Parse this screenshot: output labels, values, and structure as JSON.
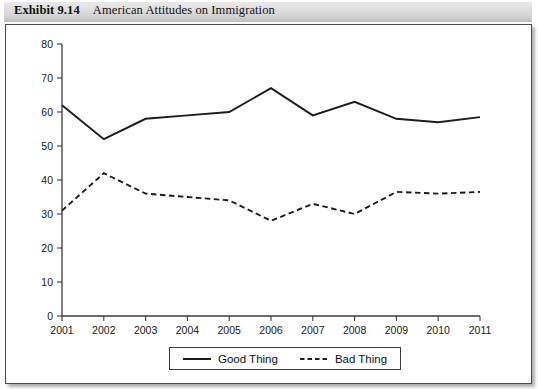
{
  "caption": {
    "exhibit_label": "Exhibit 9.14",
    "title": "American Attitudes on Immigration"
  },
  "legend": {
    "position": "bottom-center",
    "entries": [
      {
        "label": "Good Thing",
        "style": "solid",
        "color": "#1c1c1c"
      },
      {
        "label": "Bad Thing",
        "style": "dashed",
        "color": "#1c1c1c"
      }
    ]
  },
  "chart_data": {
    "type": "line",
    "title": "American Attitudes on Immigration",
    "xlabel": "",
    "ylabel": "",
    "x": [
      "2001",
      "2002",
      "2003",
      "2004",
      "2005",
      "2006",
      "2007",
      "2008",
      "2009",
      "2010",
      "2011"
    ],
    "xlim": [
      2001,
      2011
    ],
    "ylim": [
      0,
      80
    ],
    "yticks": [
      0,
      10,
      20,
      30,
      40,
      50,
      60,
      70,
      80
    ],
    "xticks": [
      "2001",
      "2002",
      "2003",
      "2004",
      "2005",
      "2006",
      "2007",
      "2008",
      "2009",
      "2010",
      "2011"
    ],
    "grid": false,
    "series": [
      {
        "name": "Good Thing",
        "style": "solid",
        "values": [
          62,
          52,
          58,
          59,
          60,
          67,
          59,
          63,
          58,
          57,
          58.5
        ]
      },
      {
        "name": "Bad Thing",
        "style": "dashed",
        "values": [
          31,
          42,
          36,
          35,
          34,
          28,
          33,
          30,
          36.5,
          36,
          36.5
        ]
      }
    ]
  }
}
